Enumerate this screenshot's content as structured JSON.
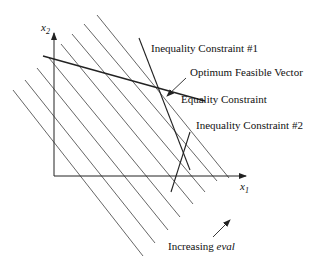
{
  "diagram": {
    "axes": {
      "x_label": "x",
      "x_sub": "1",
      "y_label": "x",
      "y_sub": "2"
    },
    "labels": {
      "ineq1": "Inequality Constraint #1",
      "optimum": "Optimum Feasible Vector",
      "equality": "Equality Constraint",
      "ineq2": "Inequality Constraint #2",
      "increasing_prefix": "Increasing ",
      "increasing_var": "eval"
    },
    "contour_line_count": 8,
    "colors": {
      "line": "#333333",
      "text": "#111111",
      "background": "#ffffff"
    }
  }
}
